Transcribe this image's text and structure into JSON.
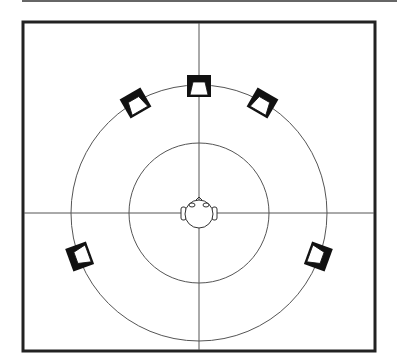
{
  "diagram": {
    "center": [
      199,
      213
    ],
    "outer_radius": 128,
    "inner_radius": 70,
    "speakers": [
      {
        "name": "center",
        "angle": 0
      },
      {
        "name": "front-left",
        "angle": -30
      },
      {
        "name": "front-right",
        "angle": 30
      },
      {
        "name": "surround-left",
        "angle": -110
      },
      {
        "name": "surround-right",
        "angle": 110
      }
    ],
    "colors": {
      "line": "#555555",
      "frame": "#222222",
      "speaker": "#111111"
    }
  }
}
